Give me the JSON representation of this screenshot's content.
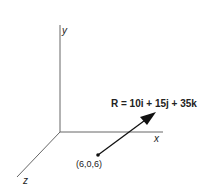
{
  "diagram": {
    "axes": {
      "x_label": "x",
      "y_label": "y",
      "z_label": "z"
    },
    "vector": {
      "label": "R = 10i + 15j + 35k",
      "start_point_label": "(6,0,6)"
    },
    "colors": {
      "line": "#555555",
      "arrow": "#111111",
      "text": "#222222"
    }
  }
}
